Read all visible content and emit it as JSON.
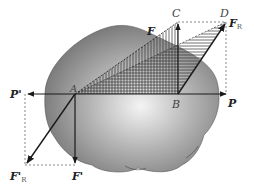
{
  "diagram": {
    "type": "force-translation-diagram",
    "colors": {
      "body_dark": "#6e6e6e",
      "body_light": "#f2f2f2",
      "line": "#1a1a1a",
      "dashed": "#555555",
      "hatch": "#333333"
    },
    "points": {
      "A": {
        "label": "A",
        "x": 75,
        "y": 94
      },
      "B": {
        "label": "B",
        "x": 178,
        "y": 94
      },
      "C": {
        "label": "C",
        "x": 178,
        "y": 22
      },
      "D": {
        "label": "D",
        "x": 226,
        "y": 22
      }
    },
    "forces": {
      "F": {
        "label": "F",
        "subscript": ""
      },
      "F_R": {
        "label": "F",
        "subscript": "R"
      },
      "P": {
        "label": "P",
        "subscript": ""
      },
      "P_prime": {
        "label": "P'",
        "subscript": ""
      },
      "F_prime": {
        "label": "F'",
        "subscript": ""
      },
      "F_R_prime": {
        "label": "F'",
        "subscript": "R"
      }
    }
  }
}
